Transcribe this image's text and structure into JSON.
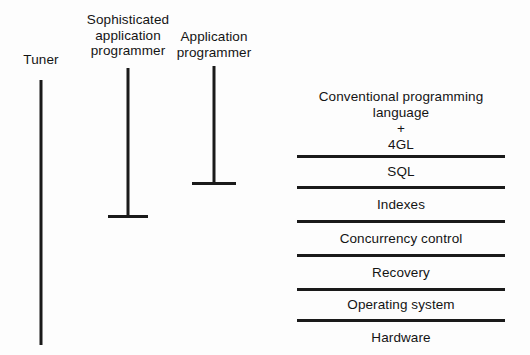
{
  "diagram": {
    "background_color": "#fdfdfd",
    "line_color": "#1a1a1a",
    "text_color": "#141414",
    "roles": [
      {
        "id": "tuner",
        "label_lines": [
          "Tuner"
        ],
        "has_foot": false,
        "reach": "hardware"
      },
      {
        "id": "sophisticated-application-programmer",
        "label_lines": [
          "Sophisticated",
          "application",
          "programmer"
        ],
        "has_foot": true,
        "reach": "indexes"
      },
      {
        "id": "application-programmer",
        "label_lines": [
          "Application",
          "programmer"
        ],
        "has_foot": true,
        "reach": "sql"
      }
    ],
    "layers": [
      {
        "id": "conventional-programming-language-4gl",
        "text_lines": [
          "Conventional programming",
          "language",
          "+",
          "4GL"
        ]
      },
      {
        "id": "sql",
        "text_lines": [
          "SQL"
        ]
      },
      {
        "id": "indexes",
        "text_lines": [
          "Indexes"
        ]
      },
      {
        "id": "concurrency-control",
        "text_lines": [
          "Concurrency control"
        ]
      },
      {
        "id": "recovery",
        "text_lines": [
          "Recovery"
        ]
      },
      {
        "id": "operating-system",
        "text_lines": [
          "Operating system"
        ]
      },
      {
        "id": "hardware",
        "text_lines": [
          "Hardware"
        ]
      }
    ]
  }
}
